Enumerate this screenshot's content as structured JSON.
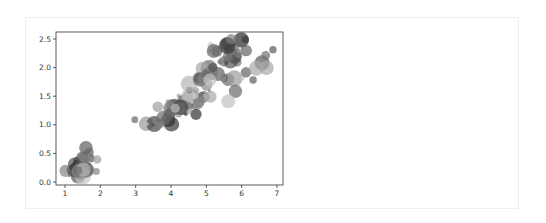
{
  "chart_data": {
    "type": "scatter",
    "title": "",
    "xlabel": "",
    "ylabel": "",
    "xlim": [
      0.7,
      7.2
    ],
    "ylim": [
      -0.05,
      2.6
    ],
    "grid": false,
    "legend": "none",
    "xticks": [
      1,
      2,
      3,
      4,
      5,
      6,
      7
    ],
    "xtick_labels": [
      "1",
      "2",
      "3",
      "4",
      "5",
      "6",
      "7"
    ],
    "yticks": [
      0.0,
      0.5,
      1.0,
      1.5,
      2.0,
      2.5
    ],
    "ytick_labels": [
      "0.0",
      "0.5",
      "1.0",
      "1.5",
      "2.0",
      "2.5"
    ],
    "marker_color": "#555555",
    "alpha": 0.7,
    "x": [
      1.4,
      1.4,
      1.3,
      1.5,
      1.4,
      1.7,
      1.4,
      1.5,
      1.4,
      1.5,
      1.5,
      1.6,
      1.4,
      1.1,
      1.2,
      1.5,
      1.3,
      1.4,
      1.7,
      1.5,
      1.7,
      1.5,
      1.0,
      1.7,
      1.9,
      1.6,
      1.6,
      1.5,
      1.4,
      1.6,
      1.6,
      1.5,
      1.5,
      1.4,
      1.5,
      1.2,
      1.3,
      1.4,
      1.3,
      1.5,
      1.3,
      1.3,
      1.3,
      1.6,
      1.9,
      1.4,
      1.6,
      1.4,
      1.5,
      1.4,
      4.7,
      4.5,
      4.9,
      4.0,
      4.6,
      4.5,
      4.7,
      3.3,
      4.6,
      3.9,
      3.5,
      4.2,
      4.0,
      4.7,
      3.6,
      4.4,
      4.5,
      4.1,
      4.5,
      3.9,
      4.8,
      4.0,
      4.9,
      4.7,
      4.3,
      4.4,
      4.8,
      5.0,
      4.5,
      3.5,
      3.8,
      3.7,
      3.9,
      5.1,
      4.5,
      4.5,
      4.7,
      4.4,
      4.1,
      4.0,
      4.4,
      4.6,
      4.0,
      3.3,
      4.2,
      4.2,
      4.2,
      4.3,
      3.0,
      4.1,
      6.0,
      5.1,
      5.9,
      5.6,
      5.8,
      6.6,
      4.5,
      6.3,
      5.8,
      6.1,
      5.1,
      5.3,
      5.5,
      5.0,
      5.1,
      5.3,
      5.5,
      6.7,
      6.9,
      5.0,
      5.7,
      4.9,
      6.7,
      4.9,
      5.7,
      6.0,
      4.8,
      4.9,
      5.6,
      5.8,
      6.1,
      6.4,
      5.6,
      5.1,
      5.6,
      6.1,
      5.6,
      5.5,
      4.8,
      5.4,
      5.6,
      5.1,
      5.1,
      5.9,
      5.7,
      5.2,
      5.0,
      5.2,
      5.4,
      5.1
    ],
    "y": [
      0.2,
      0.2,
      0.2,
      0.2,
      0.2,
      0.4,
      0.3,
      0.2,
      0.2,
      0.1,
      0.2,
      0.2,
      0.1,
      0.1,
      0.2,
      0.4,
      0.4,
      0.3,
      0.3,
      0.3,
      0.2,
      0.4,
      0.2,
      0.5,
      0.2,
      0.2,
      0.4,
      0.2,
      0.2,
      0.2,
      0.2,
      0.4,
      0.1,
      0.2,
      0.2,
      0.2,
      0.2,
      0.1,
      0.2,
      0.2,
      0.3,
      0.3,
      0.2,
      0.6,
      0.4,
      0.3,
      0.2,
      0.2,
      0.2,
      0.2,
      1.4,
      1.5,
      1.5,
      1.3,
      1.5,
      1.3,
      1.6,
      1.0,
      1.3,
      1.4,
      1.0,
      1.5,
      1.0,
      1.4,
      1.3,
      1.4,
      1.5,
      1.0,
      1.5,
      1.1,
      1.8,
      1.3,
      1.5,
      1.2,
      1.3,
      1.4,
      1.4,
      1.7,
      1.5,
      1.0,
      1.1,
      1.0,
      1.2,
      1.6,
      1.5,
      1.6,
      1.5,
      1.3,
      1.3,
      1.3,
      1.2,
      1.4,
      1.2,
      1.0,
      1.3,
      1.2,
      1.3,
      1.3,
      1.1,
      1.3,
      2.5,
      1.9,
      2.1,
      1.8,
      2.2,
      2.1,
      1.7,
      1.8,
      1.8,
      2.5,
      2.0,
      1.9,
      2.1,
      2.0,
      2.4,
      2.3,
      1.8,
      2.2,
      2.3,
      1.5,
      2.3,
      2.0,
      2.0,
      1.8,
      2.1,
      1.8,
      1.8,
      1.8,
      2.1,
      1.6,
      1.9,
      2.0,
      2.2,
      1.5,
      1.4,
      2.3,
      2.4,
      1.8,
      1.8,
      2.1,
      2.4,
      2.3,
      1.9,
      2.3,
      2.5,
      2.3,
      1.9,
      2.0,
      2.3,
      1.8
    ]
  }
}
